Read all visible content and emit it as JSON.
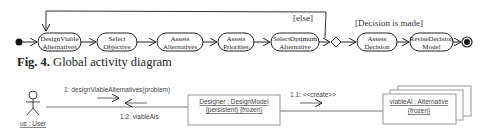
{
  "activity_diagram": {
    "loop_guard": "[else]",
    "decision_guard": "[Decision is made]",
    "nodes": [
      {
        "line1": "DesignViable",
        "line2": "Alternatives"
      },
      {
        "line1": "Select",
        "line2": "Objective"
      },
      {
        "line1": "Assess",
        "line2": "Alternatives"
      },
      {
        "line1": "Assess",
        "line2": "Priorities"
      },
      {
        "line1": "SelectOptimum",
        "line2": "Alternative"
      },
      {
        "line1": "Assess",
        "line2": "Decision"
      },
      {
        "line1": "ReviseDecision",
        "line2": "Model"
      }
    ]
  },
  "caption": {
    "label": "Fig. 4.",
    "text": " Global activity diagram"
  },
  "collaboration_diagram": {
    "actor": "us : User",
    "designer": {
      "line1": "Designer : DesignModel",
      "line2": "{persistent} {frozen}"
    },
    "alternative": {
      "line1": "viableAl : Alternative",
      "line2": "{frozen}"
    },
    "messages": {
      "m1": "1: designViableAlternatives(problem)",
      "m12": "1.2: viableAls",
      "m11": "1.1: <<create>>"
    }
  }
}
